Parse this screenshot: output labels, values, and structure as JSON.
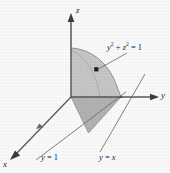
{
  "figure": {
    "background_color": "#fdfdfd",
    "line_color": "#4a4a4a",
    "text_color": "#2b2b2b"
  },
  "axes": {
    "z": {
      "label": "z",
      "arrow": "up",
      "tip": [
        71,
        14
      ],
      "origin": [
        71,
        97
      ]
    },
    "y": {
      "label": "y",
      "arrow": "right",
      "tip": [
        160,
        97
      ],
      "origin": [
        71,
        97
      ]
    },
    "x": {
      "label": "x",
      "arrow": "down-left",
      "tip": [
        10,
        158
      ],
      "origin": [
        71,
        97
      ]
    }
  },
  "regions": {
    "quarter_disk": {
      "name": "cylindrical-surface",
      "fill": "#c9c9c9",
      "stroke": "#8f8f8f",
      "description": "Shaded quarter disk of radius 1 rising from origin to z axis"
    },
    "base_triangle": {
      "name": "base-triangle",
      "fill": "#b5b5b5",
      "stroke": "#7d7d7d",
      "description": "Shaded triangle in the xy plane bounded by y equals 1 and y equals x"
    }
  },
  "labels": {
    "surface_equation": {
      "prefix": "y",
      "exp1": "2",
      "plus": " + ",
      "var2": "z",
      "exp2": "2",
      "equals": " = ",
      "value": "1",
      "pointer_from": [
        128,
        52
      ],
      "pointer_to": [
        96,
        70
      ],
      "dot": [
        96,
        70
      ]
    },
    "line_y_equals_1": {
      "var": "y",
      "equals": " = ",
      "value": "1"
    },
    "line_y_equals_x": {
      "var": "y",
      "equals": " = ",
      "value": "x"
    }
  }
}
